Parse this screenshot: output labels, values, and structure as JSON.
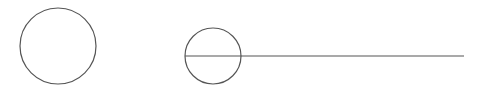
{
  "canvas": {
    "width": 482,
    "height": 91,
    "background": "#ffffff",
    "stroke": "#555555"
  },
  "shapes": {
    "circle_left": {
      "cx": 58,
      "cy": 46,
      "r": 38
    },
    "circle_right": {
      "cx": 213,
      "cy": 56,
      "r": 28
    },
    "line": {
      "x1": 185,
      "y1": 56,
      "x2": 464,
      "y2": 56
    }
  }
}
